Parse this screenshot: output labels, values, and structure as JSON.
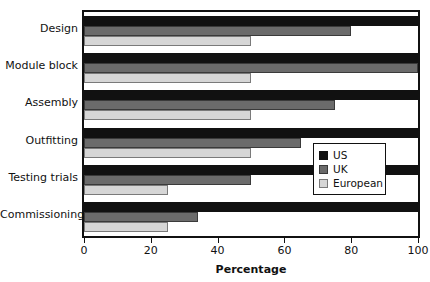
{
  "chart_data": {
    "type": "bar",
    "orientation": "horizontal",
    "title": "",
    "xlabel": "Percentage",
    "ylabel": "",
    "xlim": [
      0,
      100
    ],
    "xticks": [
      0,
      20,
      40,
      60,
      80,
      100
    ],
    "grid": false,
    "legend_position": "center-right",
    "categories": [
      "Design",
      "Module block",
      "Assembly",
      "Outfitting",
      "Testing trials",
      "Commissioning"
    ],
    "series": [
      {
        "name": "US",
        "color": "#111111",
        "values": [
          100,
          100,
          100,
          100,
          100,
          100
        ]
      },
      {
        "name": "UK",
        "color": "#6b6b6b",
        "values": [
          80,
          100,
          75,
          65,
          50,
          34
        ]
      },
      {
        "name": "European",
        "color": "#d6d6d6",
        "values": [
          50,
          50,
          50,
          50,
          25,
          25
        ]
      }
    ]
  },
  "legend": {
    "entries": [
      {
        "label": "US",
        "swatch": "us"
      },
      {
        "label": "UK",
        "swatch": "uk"
      },
      {
        "label": "European",
        "swatch": "eu"
      }
    ]
  }
}
